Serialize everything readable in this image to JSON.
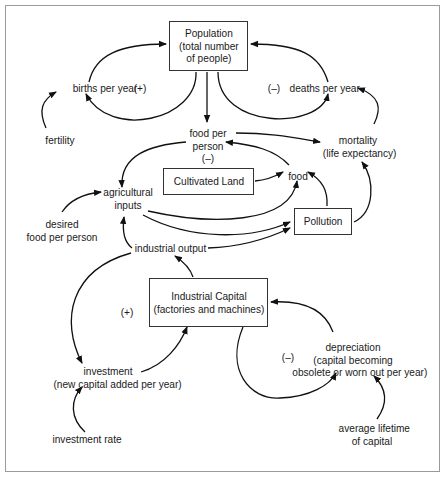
{
  "diagram": {
    "type": "causal-loop",
    "stocks": {
      "population": {
        "line1": "Population",
        "line2": "(total number",
        "line3": "of people)"
      },
      "cultivated_land": {
        "label": "Cultivated Land"
      },
      "pollution": {
        "label": "Pollution"
      },
      "industrial_capital": {
        "line1": "Industrial Capital",
        "line2": "(factories and machines)"
      }
    },
    "variables": {
      "births": {
        "label": "births per year"
      },
      "births_polarity": "(+)",
      "deaths": {
        "label": "deaths per year"
      },
      "deaths_polarity": "(–)",
      "fertility": {
        "label": "fertility"
      },
      "food_per_person": {
        "line1": "food per",
        "line2": "person",
        "polarity": "(–)"
      },
      "mortality": {
        "line1": "mortality",
        "line2": "(life expectancy)"
      },
      "food": {
        "label": "food"
      },
      "agricultural_inputs": {
        "line1": "agricultural",
        "line2": "inputs"
      },
      "desired_food": {
        "line1": "desired",
        "line2": "food per person"
      },
      "industrial_output": {
        "label": "industrial output"
      },
      "investment": {
        "line1": "investment",
        "line2": "(new capital added per year)"
      },
      "investment_polarity": "(+)",
      "depreciation": {
        "line1": "depreciation",
        "line2": "(capital becoming",
        "line3": "obsolete or worn out per year)"
      },
      "depreciation_polarity": "(–)",
      "investment_rate": {
        "label": "investment rate"
      },
      "average_lifetime": {
        "line1": "average lifetime",
        "line2": "of capital"
      }
    },
    "links": [
      {
        "from": "births per year",
        "to": "Population"
      },
      {
        "from": "Population",
        "to": "births per year"
      },
      {
        "from": "deaths per year",
        "to": "Population"
      },
      {
        "from": "Population",
        "to": "deaths per year"
      },
      {
        "from": "Population",
        "to": "food per person"
      },
      {
        "from": "fertility",
        "to": "births per year"
      },
      {
        "from": "mortality",
        "to": "deaths per year"
      },
      {
        "from": "food per person",
        "to": "mortality"
      },
      {
        "from": "food per person",
        "to": "agricultural inputs"
      },
      {
        "from": "food",
        "to": "food per person"
      },
      {
        "from": "Cultivated Land",
        "to": "food"
      },
      {
        "from": "agricultural inputs",
        "to": "food"
      },
      {
        "from": "agricultural inputs",
        "to": "Pollution"
      },
      {
        "from": "Pollution",
        "to": "food"
      },
      {
        "from": "Pollution",
        "to": "mortality"
      },
      {
        "from": "desired food per person",
        "to": "agricultural inputs"
      },
      {
        "from": "industrial output",
        "to": "agricultural inputs"
      },
      {
        "from": "industrial output",
        "to": "Pollution"
      },
      {
        "from": "industrial output",
        "to": "investment"
      },
      {
        "from": "Industrial Capital",
        "to": "industrial output"
      },
      {
        "from": "investment",
        "to": "Industrial Capital"
      },
      {
        "from": "Industrial Capital",
        "to": "depreciation"
      },
      {
        "from": "depreciation",
        "to": "Industrial Capital"
      },
      {
        "from": "investment rate",
        "to": "investment"
      },
      {
        "from": "average lifetime of capital",
        "to": "depreciation"
      }
    ]
  }
}
